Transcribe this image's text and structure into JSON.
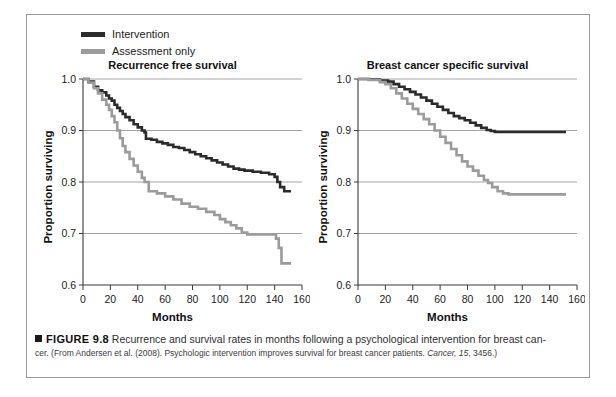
{
  "figure": {
    "legend": [
      {
        "label": "Intervention",
        "color": "#2b2b2b",
        "key": "legend-intervention"
      },
      {
        "label": "Assessment only",
        "color": "#9b9b9b",
        "key": "legend-assessment-only"
      }
    ],
    "caption": {
      "marker": "■",
      "figure_number": "FIGURE 9.8",
      "line1": "Recurrence and survival rates in months following a psychological intervention for breast can-",
      "line2_pre": "cer.  (From Andersen et al. (2008). Psychologic intervention improves survival for breast cancer patients. ",
      "line2_journal": "Cancer,",
      "line2_vol": " 15",
      "line2_post": ", 3456.)"
    }
  },
  "chart_data": [
    {
      "type": "line",
      "id": "recurrence-free-survival",
      "title": "Recurrence free survival",
      "xlabel": "Months",
      "ylabel": "Proportion surviving",
      "xlim": [
        0,
        160
      ],
      "ylim": [
        0.6,
        1.0
      ],
      "xticks": [
        0,
        20,
        40,
        60,
        80,
        100,
        120,
        140,
        160
      ],
      "yticks": [
        0.6,
        0.7,
        0.8,
        0.9,
        1.0
      ],
      "ytick_labels": [
        "0.6",
        "0.7",
        "0.8",
        "0.9",
        "1.0"
      ],
      "grid": "horizontal",
      "legend_position": "above-figure",
      "step": true,
      "series": [
        {
          "name": "Intervention",
          "color": "#2b2b2b",
          "x": [
            0,
            4,
            8,
            11,
            14,
            17,
            19,
            21,
            23,
            25,
            27,
            29,
            31,
            34,
            37,
            40,
            43,
            45,
            46,
            50,
            54,
            58,
            62,
            66,
            70,
            74,
            78,
            82,
            86,
            90,
            94,
            98,
            102,
            106,
            110,
            114,
            118,
            124,
            130,
            136,
            140,
            142,
            144,
            147,
            152
          ],
          "y": [
            1.0,
            0.995,
            0.985,
            0.978,
            0.974,
            0.968,
            0.962,
            0.958,
            0.95,
            0.944,
            0.938,
            0.932,
            0.926,
            0.92,
            0.912,
            0.906,
            0.9,
            0.896,
            0.884,
            0.882,
            0.878,
            0.875,
            0.872,
            0.868,
            0.866,
            0.862,
            0.858,
            0.854,
            0.85,
            0.846,
            0.842,
            0.838,
            0.834,
            0.83,
            0.826,
            0.824,
            0.822,
            0.82,
            0.818,
            0.815,
            0.81,
            0.8,
            0.79,
            0.782,
            0.782
          ]
        },
        {
          "name": "Assessment only",
          "color": "#9b9b9b",
          "x": [
            0,
            4,
            8,
            11,
            14,
            17,
            19,
            21,
            23,
            25,
            27,
            29,
            31,
            34,
            37,
            40,
            43,
            45,
            48,
            54,
            60,
            66,
            72,
            78,
            84,
            90,
            96,
            100,
            104,
            108,
            112,
            116,
            120,
            126,
            132,
            138,
            141,
            143,
            145,
            152
          ],
          "y": [
            1.0,
            0.993,
            0.982,
            0.972,
            0.96,
            0.95,
            0.94,
            0.928,
            0.916,
            0.9,
            0.885,
            0.87,
            0.858,
            0.845,
            0.832,
            0.82,
            0.808,
            0.8,
            0.782,
            0.778,
            0.772,
            0.766,
            0.758,
            0.752,
            0.748,
            0.742,
            0.736,
            0.728,
            0.722,
            0.716,
            0.71,
            0.702,
            0.698,
            0.698,
            0.698,
            0.698,
            0.69,
            0.672,
            0.642,
            0.642
          ]
        }
      ]
    },
    {
      "type": "line",
      "id": "breast-cancer-specific-survival",
      "title": "Breast cancer specific survival",
      "xlabel": "Months",
      "ylabel": "Proportion surviving",
      "xlim": [
        0,
        160
      ],
      "ylim": [
        0.6,
        1.0
      ],
      "xticks": [
        0,
        20,
        40,
        60,
        80,
        100,
        120,
        140,
        160
      ],
      "yticks": [
        0.6,
        0.7,
        0.8,
        0.9,
        1.0
      ],
      "ytick_labels": [
        "0.6",
        "0.7",
        "0.8",
        "0.9",
        "1.0"
      ],
      "grid": "horizontal",
      "legend_position": "above-figure",
      "step": true,
      "series": [
        {
          "name": "Intervention",
          "color": "#2b2b2b",
          "x": [
            0,
            8,
            16,
            22,
            26,
            30,
            34,
            38,
            42,
            46,
            50,
            54,
            58,
            62,
            66,
            70,
            74,
            78,
            82,
            86,
            90,
            94,
            97,
            100,
            110,
            125,
            140,
            152
          ],
          "y": [
            1.0,
            0.999,
            0.997,
            0.995,
            0.99,
            0.985,
            0.98,
            0.975,
            0.97,
            0.964,
            0.958,
            0.952,
            0.946,
            0.94,
            0.934,
            0.928,
            0.924,
            0.92,
            0.915,
            0.91,
            0.905,
            0.901,
            0.899,
            0.897,
            0.897,
            0.897,
            0.897,
            0.897
          ]
        },
        {
          "name": "Assessment only",
          "color": "#9b9b9b",
          "x": [
            0,
            8,
            16,
            20,
            24,
            28,
            32,
            36,
            40,
            44,
            48,
            52,
            56,
            60,
            64,
            68,
            72,
            76,
            80,
            84,
            88,
            92,
            95,
            98,
            102,
            106,
            110,
            125,
            140,
            152
          ],
          "y": [
            1.0,
            0.998,
            0.994,
            0.99,
            0.982,
            0.972,
            0.962,
            0.952,
            0.942,
            0.932,
            0.922,
            0.912,
            0.9,
            0.888,
            0.876,
            0.864,
            0.852,
            0.84,
            0.83,
            0.822,
            0.812,
            0.804,
            0.798,
            0.79,
            0.782,
            0.778,
            0.776,
            0.776,
            0.776,
            0.776
          ]
        }
      ]
    }
  ]
}
